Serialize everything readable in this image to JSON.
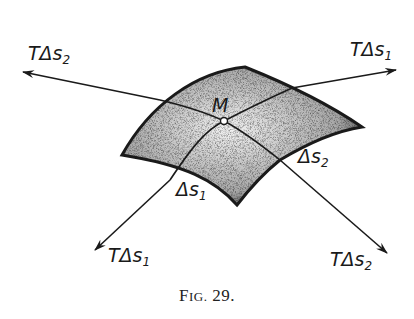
{
  "figure": {
    "caption_prefix_big": "F",
    "caption_prefix_small": "IG.",
    "caption_number": "29.",
    "point_label": "M",
    "labels": {
      "tangent_s2_upper_left": {
        "T": "T",
        "delta": "Δ",
        "s": "s",
        "sub": "2"
      },
      "tangent_s1_upper_right": {
        "T": "T",
        "delta": "Δ",
        "s": "s",
        "sub": "1"
      },
      "tangent_s1_lower_left": {
        "T": "T",
        "delta": "Δ",
        "s": "s",
        "sub": "1"
      },
      "tangent_s2_lower_right": {
        "T": "T",
        "delta": "Δ",
        "s": "s",
        "sub": "2"
      },
      "arc_s2": {
        "delta": "Δ",
        "s": "s",
        "sub": "2"
      },
      "arc_s1": {
        "delta": "Δ",
        "s": "s",
        "sub": "1"
      }
    },
    "colors": {
      "ink": "#1a1a1a",
      "background": "#ffffff"
    }
  }
}
